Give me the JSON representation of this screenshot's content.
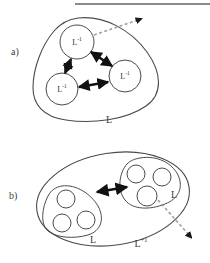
{
  "figure": {
    "width": 210,
    "height": 263,
    "background": "#ffffff",
    "rule_color": "#8a8a8a",
    "stroke_color": "#4a4a4a",
    "arrow_solid_color": "#111111",
    "arrow_dashed_color": "#9a9a9a"
  },
  "top_rule": {
    "name": "horizontal-rule",
    "x": 75,
    "y": 3,
    "width": 135,
    "height": 2
  },
  "panels": [
    {
      "id": "a",
      "label": "a)",
      "label_x": 11,
      "label_y": 46,
      "outer_set_label": "L",
      "outer_set_label_x": 109,
      "outer_set_label_y": 119,
      "nodes": [
        {
          "label": "L",
          "superscript": "-1",
          "cx": 77,
          "cy": 42,
          "r": 17
        },
        {
          "label": "L",
          "superscript": "-1",
          "cx": 62,
          "cy": 89,
          "r": 16
        },
        {
          "label": "L",
          "superscript": "-1",
          "cx": 125,
          "cy": 76,
          "r": 16
        }
      ],
      "solid_arrows": [
        {
          "from": "top",
          "to": "bottom-left"
        },
        {
          "from": "top",
          "to": "right"
        },
        {
          "from": "bottom-left",
          "to": "right"
        }
      ],
      "dashed_arrow": {
        "from_node": "top",
        "direction": "up-right",
        "head": "filled-triangle"
      }
    },
    {
      "id": "b",
      "label": "b)",
      "label_x": 9,
      "label_y": 190,
      "outer_set_label": "L",
      "outer_set_superscript": "+1",
      "outer_set_label_x": 141,
      "outer_set_label_y": 243,
      "groups": [
        {
          "name": "left-group",
          "set_label": "L",
          "set_label_x": 93,
          "set_label_y": 237,
          "nodes": [
            {
              "cx": 66,
              "cy": 199,
              "r": 9
            },
            {
              "cx": 62,
              "cy": 223,
              "r": 9
            },
            {
              "cx": 85,
              "cy": 219,
              "r": 9
            }
          ]
        },
        {
          "name": "right-group",
          "set_label": "L",
          "set_label_x": 173,
          "set_label_y": 193,
          "nodes": [
            {
              "cx": 135,
              "cy": 173,
              "r": 9
            },
            {
              "cx": 161,
              "cy": 176,
              "r": 9
            },
            {
              "cx": 146,
              "cy": 196,
              "r": 10
            }
          ]
        }
      ],
      "solid_arrows": [
        {
          "from": "left-group",
          "to": "right-group"
        }
      ],
      "dashed_arrow": {
        "from_node": "right-group",
        "direction": "down-right",
        "head": "filled-triangle"
      }
    }
  ]
}
